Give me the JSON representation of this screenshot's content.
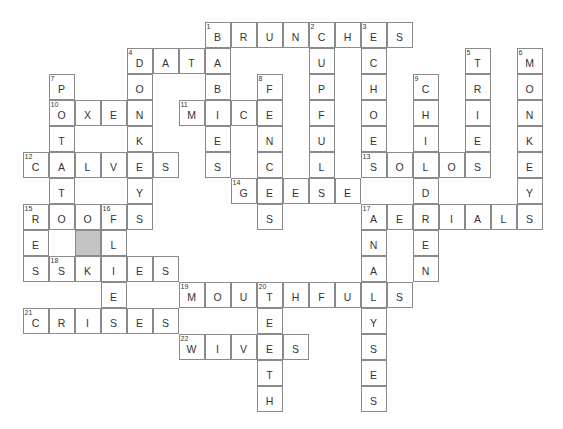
{
  "puzzle": {
    "type": "crossword",
    "cell_size": 26,
    "origin": {
      "x": 23,
      "y": 22
    },
    "colors": {
      "border": "#8a8a8a",
      "text": "#333333",
      "shaded": "#c4c4c4",
      "background": "#ffffff"
    },
    "shaded_cells": [
      {
        "row": 8,
        "col": 2
      }
    ],
    "across": [
      {
        "number": 1,
        "answer": "BRUNCHES",
        "row": 0,
        "col": 7
      },
      {
        "number": 4,
        "answer": "DATA",
        "row": 1,
        "col": 4
      },
      {
        "number": 10,
        "answer": "OXEN",
        "row": 3,
        "col": 1
      },
      {
        "number": 11,
        "answer": "MICE",
        "row": 3,
        "col": 6
      },
      {
        "number": 12,
        "answer": "CALVES",
        "row": 5,
        "col": 0
      },
      {
        "number": 13,
        "answer": "SOLOS",
        "row": 5,
        "col": 13
      },
      {
        "number": 14,
        "answer": "GEESE",
        "row": 6,
        "col": 8
      },
      {
        "number": 15,
        "answer": "ROOFS",
        "row": 7,
        "col": 0
      },
      {
        "number": 17,
        "answer": "AERIALS",
        "row": 7,
        "col": 13
      },
      {
        "number": 18,
        "answer": "SKIES",
        "row": 9,
        "col": 1
      },
      {
        "number": 19,
        "answer": "MOUTHFULS",
        "row": 10,
        "col": 6
      },
      {
        "number": 21,
        "answer": "CRISES",
        "row": 11,
        "col": 0
      },
      {
        "number": 22,
        "answer": "WIVES",
        "row": 12,
        "col": 6
      }
    ],
    "down": [
      {
        "number": 1,
        "answer": "BABIES",
        "row": 0,
        "col": 7
      },
      {
        "number": 2,
        "answer": "CUPFULS",
        "row": 0,
        "col": 11
      },
      {
        "number": 3,
        "answer": "ECHOES",
        "row": 0,
        "col": 13
      },
      {
        "number": 4,
        "answer": "DONKEYS",
        "row": 1,
        "col": 4
      },
      {
        "number": 5,
        "answer": "TRIES",
        "row": 1,
        "col": 17
      },
      {
        "number": 6,
        "answer": "MONKEY",
        "row": 1,
        "col": 19
      },
      {
        "number": 7,
        "answer": "POTATO",
        "row": 2,
        "col": 1
      },
      {
        "number": 8,
        "answer": "FENCES",
        "row": 2,
        "col": 9
      },
      {
        "number": 9,
        "answer": "CHILD",
        "row": 2,
        "col": 15
      },
      {
        "number": 15,
        "answer": "RES",
        "row": 7,
        "col": 0
      },
      {
        "number": 16,
        "answer": "FLIES",
        "row": 7,
        "col": 3
      },
      {
        "number": 17,
        "answer": "ANALYSES",
        "row": 7,
        "col": 13
      },
      {
        "number": 20,
        "answer": "TEETH",
        "row": 10,
        "col": 9
      },
      {
        "number": 0,
        "answer": "REN",
        "row": 7,
        "col": 15
      }
    ]
  }
}
